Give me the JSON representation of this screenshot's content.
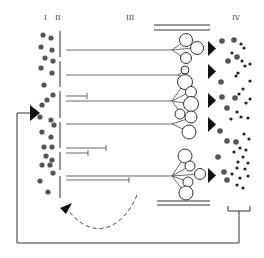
{
  "labels": {
    "col_I": "I",
    "col_II": "II",
    "col_III": "III",
    "col_IV": "IV"
  },
  "colors": {
    "stroke": "#333333",
    "dot_large": "#555555",
    "dot_small": "#222222",
    "background": "#ffffff"
  },
  "left_column_dots": [
    [
      43,
      35
    ],
    [
      51,
      38
    ],
    [
      41,
      47
    ],
    [
      52,
      50
    ],
    [
      45,
      58
    ],
    [
      53,
      61
    ],
    [
      41,
      68
    ],
    [
      52,
      73
    ],
    [
      44,
      85
    ],
    [
      53,
      95
    ],
    [
      47,
      100
    ],
    [
      42,
      105
    ],
    [
      40,
      117
    ],
    [
      51,
      120
    ],
    [
      54,
      125
    ],
    [
      42,
      132
    ],
    [
      51,
      137
    ],
    [
      52,
      147
    ],
    [
      44,
      147
    ],
    [
      46,
      156
    ],
    [
      52,
      160
    ],
    [
      42,
      165
    ],
    [
      50,
      165
    ],
    [
      53,
      173
    ],
    [
      40,
      181
    ],
    [
      48,
      192
    ]
  ],
  "right_column_big_dots": [
    [
      222,
      41
    ],
    [
      234,
      40
    ],
    [
      228,
      61
    ],
    [
      237,
      57
    ],
    [
      221,
      82
    ],
    [
      222,
      97
    ],
    [
      235,
      98
    ],
    [
      227,
      108
    ],
    [
      220,
      131
    ],
    [
      227,
      141
    ],
    [
      236,
      142
    ],
    [
      218,
      157
    ],
    [
      224,
      172
    ],
    [
      227,
      180
    ]
  ],
  "right_column_small_dots": [
    [
      244,
      48
    ],
    [
      241,
      44
    ],
    [
      232,
      53
    ],
    [
      242,
      61
    ],
    [
      245,
      66
    ],
    [
      238,
      73
    ],
    [
      250,
      64
    ],
    [
      236,
      76
    ],
    [
      250,
      81
    ],
    [
      243,
      89
    ],
    [
      239,
      94
    ],
    [
      246,
      103
    ],
    [
      237,
      112
    ],
    [
      241,
      117
    ],
    [
      250,
      99
    ],
    [
      231,
      119
    ],
    [
      248,
      118
    ],
    [
      244,
      134
    ],
    [
      249,
      139
    ],
    [
      240,
      148
    ],
    [
      246,
      150
    ],
    [
      234,
      152
    ],
    [
      243,
      157
    ],
    [
      238,
      162
    ],
    [
      248,
      163
    ],
    [
      237,
      168
    ],
    [
      245,
      169
    ],
    [
      232,
      174
    ],
    [
      240,
      178
    ],
    [
      248,
      176
    ],
    [
      237,
      185
    ],
    [
      243,
      188
    ]
  ],
  "axon_lines": [
    {
      "y": 50,
      "x_end": 172,
      "type": "terminal"
    },
    {
      "y": 75,
      "x_end": 178,
      "type": "terminal"
    },
    {
      "y": 101,
      "x_end": 172,
      "type": "terminal"
    },
    {
      "y": 96,
      "x_end": 87,
      "type": "blocked"
    },
    {
      "y": 124,
      "x_end": 172,
      "type": "terminal"
    },
    {
      "y": 148,
      "x_end": 106,
      "type": "blocked"
    },
    {
      "y": 153,
      "x_end": 88,
      "type": "blocked"
    },
    {
      "y": 176,
      "x_end": 172,
      "type": "terminal"
    },
    {
      "y": 180,
      "x_end": 129,
      "type": "blocked"
    }
  ]
}
